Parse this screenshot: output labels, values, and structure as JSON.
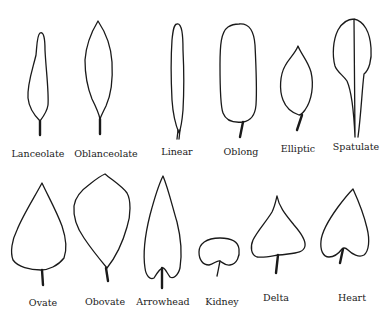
{
  "rows": [
    {
      "leaves": [
        {
          "id": "lanceolate",
          "label": "Lanceolate"
        },
        {
          "id": "oblanceolate",
          "label": "Oblanceolate"
        },
        {
          "id": "linear",
          "label": "Linear"
        },
        {
          "id": "oblong",
          "label": "Oblong"
        },
        {
          "id": "elliptic",
          "label": "Elliptic"
        },
        {
          "id": "spatulate",
          "label": "Spatulate"
        }
      ]
    },
    {
      "leaves": [
        {
          "id": "ovate",
          "label": "Ovate"
        },
        {
          "id": "obovate",
          "label": "Obovate"
        },
        {
          "id": "arrowhead",
          "label": "Arrowhead"
        },
        {
          "id": "kidney",
          "label": "Kidney"
        },
        {
          "id": "delta",
          "label": "Delta"
        },
        {
          "id": "heart",
          "label": "Heart"
        }
      ]
    }
  ]
}
